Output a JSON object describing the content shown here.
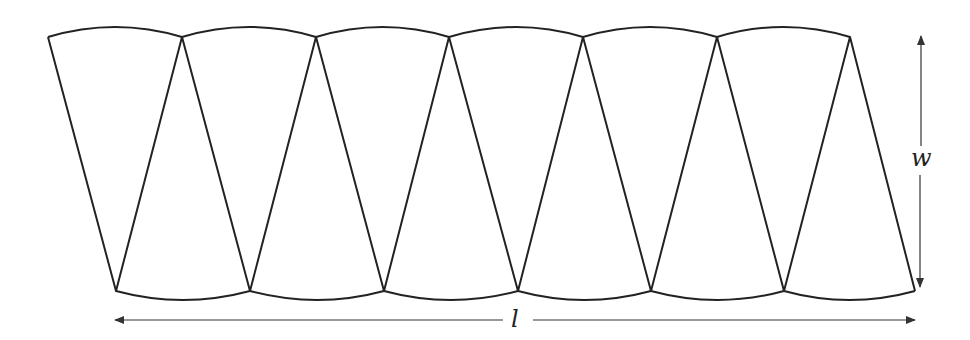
{
  "diagram": {
    "stroke_color": "#222222",
    "arrow_color": "#333333",
    "top_vertices_x": [
      48,
      182,
      316,
      449,
      583,
      717,
      850
    ],
    "bottom_vertices_x": [
      116,
      250,
      384,
      518,
      651,
      784,
      915
    ],
    "top_y": 37,
    "bottom_y": 291,
    "top_arc_peak_offset": 10,
    "bottom_arc_sag_offset": 9,
    "labels": {
      "width": "w",
      "length": "l"
    }
  }
}
